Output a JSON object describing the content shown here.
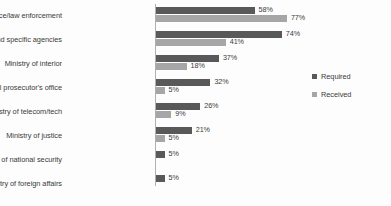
{
  "chart_data": {
    "type": "bar",
    "orientation": "horizontal",
    "title": "",
    "xlabel": "",
    "ylabel": "",
    "grid": false,
    "legend_position": "right",
    "xlim": [
      0,
      80
    ],
    "value_suffix": "%",
    "categories": [
      "National police/law enforcement",
      "Multiple and specific agencies",
      "Ministry of interior",
      "General prosecutor's office",
      "Ministry of telecom/tech",
      "Ministry of justice",
      "Ministry of national security",
      "Ministry of foreign affairs"
    ],
    "series": [
      {
        "name": "Required",
        "color": "#595959",
        "values": [
          58,
          74,
          37,
          32,
          26,
          21,
          5,
          5
        ],
        "labels": [
          "58%",
          "74%",
          "37%",
          "32%",
          "26%",
          "21%",
          "5%",
          "5%"
        ]
      },
      {
        "name": "Received",
        "color": "#a6a6a6",
        "values": [
          77,
          41,
          18,
          5,
          9,
          5,
          null,
          null
        ],
        "labels": [
          "77%",
          "41%",
          "18%",
          "5%",
          "9%",
          "5%",
          "",
          ""
        ]
      }
    ]
  },
  "legend": {
    "items": [
      {
        "label": "Required",
        "color": "#595959"
      },
      {
        "label": "Received",
        "color": "#a6a6a6"
      }
    ]
  }
}
